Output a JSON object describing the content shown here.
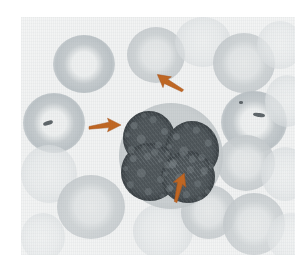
{
  "figure": {
    "kind": "photomicrograph",
    "subject": "peripheral blood smear",
    "alt_text": "Light photomicrograph of a peripheral blood smear showing a single leukocyte with a dark, coarsely clumped, multi-lobed nucleus surrounded by pale erythrocytes with central pallor. Three orange arrows point to the cell.",
    "plate": {
      "x": 21,
      "y": 17,
      "width": 274,
      "height": 238,
      "background_color": "#f2f3f3",
      "border_color": "#ffffff"
    }
  },
  "palette": {
    "arrow_color": "#c1651f",
    "arrow_color_dark": "#a9531a",
    "nucleus_color": "#4c5357",
    "nucleus_shadow": "#1c2124",
    "cytoplasm_color": "#c9ced0",
    "erythrocyte_color": "#ced3d6",
    "erythrocyte_pallor": "#f1f2f2",
    "inclusion_color": "#5d6468",
    "plate_background": "#f2f3f3",
    "page_background": "#ffffff"
  },
  "leukocyte": {
    "label": "leukocyte",
    "x": 98,
    "y": 86,
    "width": 104,
    "height": 106,
    "nucleus_lobes": [
      {
        "label": "upper-left-lobe",
        "x": 4,
        "y": 8,
        "width": 52,
        "height": 54
      },
      {
        "label": "right-lobe",
        "x": 46,
        "y": 18,
        "width": 54,
        "height": 58
      },
      {
        "label": "lower-left-lobe",
        "x": 2,
        "y": 40,
        "width": 58,
        "height": 58
      },
      {
        "label": "lower-right-lobe",
        "x": 42,
        "y": 48,
        "width": 54,
        "height": 52
      }
    ]
  },
  "erythrocytes": [
    {
      "label": "rbc-top-left-ring",
      "style": "ring",
      "x": 32,
      "y": 18,
      "width": 62,
      "height": 58
    },
    {
      "label": "rbc-top-center",
      "style": "disc",
      "x": 106,
      "y": 10,
      "width": 58,
      "height": 56
    },
    {
      "label": "rbc-top-center-right",
      "style": "faint",
      "x": 154,
      "y": 0,
      "width": 56,
      "height": 50
    },
    {
      "label": "rbc-top-right",
      "style": "disc",
      "x": 192,
      "y": 16,
      "width": 62,
      "height": 60
    },
    {
      "label": "rbc-top-right-edge",
      "style": "faint",
      "x": 236,
      "y": 4,
      "width": 46,
      "height": 48
    },
    {
      "label": "rbc-left-ring-inclusion",
      "style": "ring",
      "x": 2,
      "y": 76,
      "width": 62,
      "height": 60
    },
    {
      "label": "rbc-right-ring-inclusion",
      "style": "ring",
      "x": 200,
      "y": 74,
      "width": 66,
      "height": 62
    },
    {
      "label": "rbc-far-right-upper",
      "style": "faint",
      "x": 244,
      "y": 58,
      "width": 44,
      "height": 52
    },
    {
      "label": "rbc-left-lower",
      "style": "faint",
      "x": 0,
      "y": 128,
      "width": 56,
      "height": 58
    },
    {
      "label": "rbc-right-mid",
      "style": "disc",
      "x": 196,
      "y": 118,
      "width": 58,
      "height": 56
    },
    {
      "label": "rbc-far-right-lower",
      "style": "faint",
      "x": 240,
      "y": 130,
      "width": 48,
      "height": 54
    },
    {
      "label": "rbc-bottom-left",
      "style": "disc",
      "x": 36,
      "y": 158,
      "width": 68,
      "height": 64
    },
    {
      "label": "rbc-bottom-center",
      "style": "faint",
      "x": 112,
      "y": 186,
      "width": 60,
      "height": 56
    },
    {
      "label": "rbc-bottom-center-right",
      "style": "disc",
      "x": 160,
      "y": 168,
      "width": 56,
      "height": 54
    },
    {
      "label": "rbc-bottom-right",
      "style": "disc",
      "x": 202,
      "y": 176,
      "width": 62,
      "height": 62
    },
    {
      "label": "rbc-bottom-far-right",
      "style": "faint",
      "x": 246,
      "y": 196,
      "width": 48,
      "height": 48
    },
    {
      "label": "rbc-bottom-far-left",
      "style": "faint",
      "x": 0,
      "y": 196,
      "width": 44,
      "height": 48
    }
  ],
  "inclusions": [
    {
      "label": "inclusion-left-rbc",
      "x": 22,
      "y": 104,
      "width": 10,
      "height": 4
    },
    {
      "label": "inclusion-right-rbc",
      "x": 232,
      "y": 96,
      "width": 12,
      "height": 4
    },
    {
      "label": "inclusion-right-dot",
      "x": 218,
      "y": 84,
      "width": 4,
      "height": 3
    }
  ],
  "arrows": [
    {
      "label": "arrow-left",
      "points_to": "left nuclear lobe / cytoplasm margin",
      "x": 68,
      "y": 100,
      "length": 34,
      "rotation_deg": 0
    },
    {
      "label": "arrow-upper-right",
      "points_to": "upper-right cytoplasm notch",
      "x": 160,
      "y": 72,
      "length": 32,
      "rotation_deg": 218
    },
    {
      "label": "arrow-bottom",
      "points_to": "lower cytoplasm margin",
      "x": 152,
      "y": 178,
      "length": 32,
      "rotation_deg": 292
    }
  ]
}
